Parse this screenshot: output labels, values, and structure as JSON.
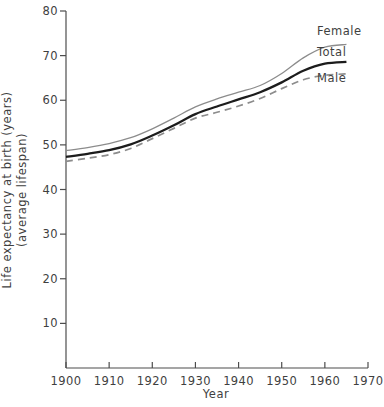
{
  "chart_data": {
    "type": "line",
    "title": "",
    "xlabel": "Year",
    "ylabel_line1": "Life expectancy at birth (years)",
    "ylabel_line2": "(average lifespan)",
    "xlim": [
      1900,
      1970
    ],
    "ylim": [
      0,
      80
    ],
    "xticks": [
      1900,
      1910,
      1920,
      1930,
      1940,
      1950,
      1960,
      1970
    ],
    "xtick_labels": [
      "1900",
      "1910",
      "1920",
      "1930",
      "1940",
      "1950",
      "1960",
      "1970"
    ],
    "yticks": [
      10,
      20,
      30,
      40,
      50,
      60,
      70,
      80
    ],
    "ytick_labels": [
      "10",
      "20",
      "30",
      "40",
      "50",
      "60",
      "70",
      "80"
    ],
    "grid": false,
    "legend_position": "inline-right",
    "x": [
      1900,
      1905,
      1910,
      1915,
      1920,
      1925,
      1930,
      1935,
      1940,
      1945,
      1950,
      1955,
      1960,
      1965
    ],
    "series": [
      {
        "name": "Female",
        "label": "Female",
        "color": "#8c8c8c",
        "style": "solid",
        "width": 1.3,
        "values": [
          48.7,
          49.4,
          50.3,
          51.6,
          53.6,
          56.0,
          58.5,
          60.3,
          61.8,
          63.3,
          66.0,
          69.5,
          71.9,
          72.5
        ]
      },
      {
        "name": "Total",
        "label": "Total",
        "color": "#1c1c1c",
        "style": "solid",
        "width": 2.3,
        "values": [
          47.3,
          48.0,
          48.8,
          50.1,
          52.1,
          54.4,
          56.9,
          58.6,
          60.2,
          61.8,
          64.0,
          66.6,
          68.2,
          68.6
        ]
      },
      {
        "name": "Male",
        "label": "Male",
        "color": "#8c8c8c",
        "style": "dashed",
        "width": 1.7,
        "values": [
          46.3,
          47.0,
          47.8,
          49.2,
          51.4,
          53.7,
          56.0,
          57.3,
          58.7,
          60.4,
          62.6,
          64.6,
          65.6,
          65.9
        ]
      }
    ],
    "annotations": [
      {
        "text": "Female",
        "x_px": 317,
        "y_px": 24
      },
      {
        "text": "Total",
        "x_px": 317,
        "y_px": 45
      },
      {
        "text": "Male",
        "x_px": 317,
        "y_px": 71
      }
    ]
  }
}
